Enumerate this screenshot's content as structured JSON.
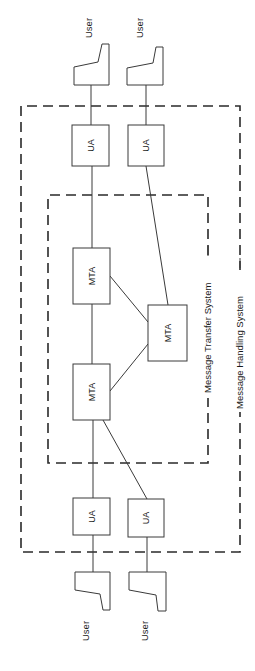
{
  "diagram": {
    "title": "Message Handling System",
    "systems": {
      "mhs_label": "Message Handling System",
      "mts_label": "Message Transfer System"
    },
    "users": {
      "top_left": "User",
      "top_right": "User",
      "bottom_left": "User",
      "bottom_right": "User"
    },
    "agents": {
      "ua_top_left": "UA",
      "ua_top_right": "UA",
      "ua_bottom_left": "UA",
      "ua_bottom_right": "UA"
    },
    "transfer_agents": {
      "mta_top": "MTA",
      "mta_bottom": "MTA",
      "mta_right": "MTA"
    },
    "colors": {
      "line": "#3a3a3a",
      "background": "#ffffff"
    }
  }
}
